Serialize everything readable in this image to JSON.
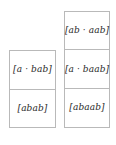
{
  "figure": {
    "background_color": "#ffffff",
    "border_color": "#b9b9b9",
    "text_color": "#2a2a2a",
    "columns": [
      {
        "name": "left-stack",
        "cells": [
          {
            "text": "[a · bab]"
          },
          {
            "text": "[abab]"
          }
        ]
      },
      {
        "name": "right-stack",
        "cells": [
          {
            "text": "[ab · aab]"
          },
          {
            "text": "[a · baab]"
          },
          {
            "text": "[abaab]"
          }
        ]
      }
    ]
  }
}
